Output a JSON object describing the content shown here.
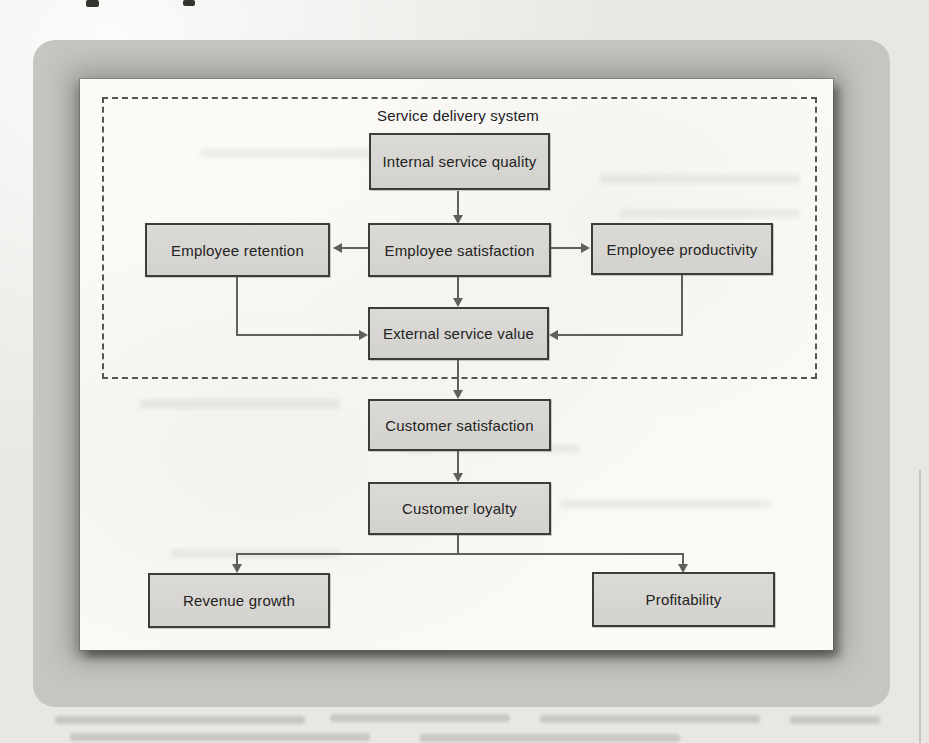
{
  "figure": {
    "boundary_label": "Service delivery system",
    "nodes": [
      {
        "id": "internal-service-quality",
        "label": "Internal service quality"
      },
      {
        "id": "employee-retention",
        "label": "Employee retention"
      },
      {
        "id": "employee-satisfaction",
        "label": "Employee satisfaction"
      },
      {
        "id": "employee-productivity",
        "label": "Employee productivity"
      },
      {
        "id": "external-service-value",
        "label": "External service value"
      },
      {
        "id": "customer-satisfaction",
        "label": "Customer satisfaction"
      },
      {
        "id": "customer-loyalty",
        "label": "Customer loyalty"
      },
      {
        "id": "revenue-growth",
        "label": "Revenue growth"
      },
      {
        "id": "profitability",
        "label": "Profitability"
      }
    ],
    "edges": [
      {
        "from": "internal-service-quality",
        "to": "employee-satisfaction"
      },
      {
        "from": "employee-satisfaction",
        "to": "employee-retention"
      },
      {
        "from": "employee-satisfaction",
        "to": "employee-productivity"
      },
      {
        "from": "employee-satisfaction",
        "to": "external-service-value"
      },
      {
        "from": "employee-retention",
        "to": "external-service-value"
      },
      {
        "from": "employee-productivity",
        "to": "external-service-value"
      },
      {
        "from": "external-service-value",
        "to": "customer-satisfaction"
      },
      {
        "from": "customer-satisfaction",
        "to": "customer-loyalty"
      },
      {
        "from": "customer-loyalty",
        "to": "revenue-growth"
      },
      {
        "from": "customer-loyalty",
        "to": "profitability"
      }
    ],
    "colors": {
      "node_fill": "#d7d6d3",
      "node_border": "#3c3c3a",
      "edge": "#5f5f5d",
      "boundary_dash": "#55554f",
      "panel": "#fbfaf7",
      "frame": "#c6c5c2",
      "page": "#e8e7e3"
    }
  }
}
